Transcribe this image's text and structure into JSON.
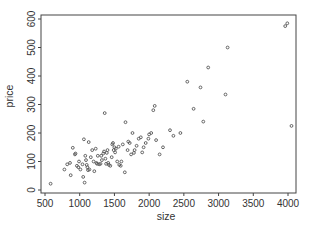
{
  "chart_data": {
    "type": "scatter",
    "title": "",
    "xlabel": "size",
    "ylabel": "price",
    "xlim": [
      430,
      4120
    ],
    "ylim": [
      -10,
      615
    ],
    "xticks": [
      500,
      1000,
      1500,
      2000,
      2500,
      3000,
      3500,
      4000
    ],
    "yticks": [
      0,
      100,
      200,
      300,
      400,
      500,
      600
    ],
    "xtick_labels": [
      "500",
      "1000",
      "1500",
      "2000",
      "2500",
      "3000",
      "3500",
      "4000"
    ],
    "ytick_labels": [
      "0",
      "100",
      "200",
      "300",
      "400",
      "500",
      "600"
    ],
    "grid": false,
    "legend": null,
    "marker_color": "#555555",
    "points": [
      [
        580,
        22
      ],
      [
        780,
        72
      ],
      [
        820,
        90
      ],
      [
        860,
        95
      ],
      [
        870,
        52
      ],
      [
        900,
        148
      ],
      [
        930,
        125
      ],
      [
        940,
        128
      ],
      [
        960,
        85
      ],
      [
        980,
        80
      ],
      [
        990,
        100
      ],
      [
        1010,
        72
      ],
      [
        1040,
        90
      ],
      [
        1050,
        46
      ],
      [
        1060,
        178
      ],
      [
        1070,
        26
      ],
      [
        1080,
        120
      ],
      [
        1090,
        105
      ],
      [
        1100,
        88
      ],
      [
        1110,
        80
      ],
      [
        1120,
        70
      ],
      [
        1130,
        168
      ],
      [
        1140,
        72
      ],
      [
        1160,
        115
      ],
      [
        1180,
        140
      ],
      [
        1200,
        100
      ],
      [
        1210,
        66
      ],
      [
        1230,
        145
      ],
      [
        1240,
        95
      ],
      [
        1250,
        92
      ],
      [
        1260,
        120
      ],
      [
        1280,
        90
      ],
      [
        1300,
        92
      ],
      [
        1310,
        120
      ],
      [
        1320,
        105
      ],
      [
        1340,
        128
      ],
      [
        1350,
        135
      ],
      [
        1360,
        270
      ],
      [
        1370,
        110
      ],
      [
        1380,
        92
      ],
      [
        1390,
        130
      ],
      [
        1400,
        140
      ],
      [
        1410,
        95
      ],
      [
        1420,
        88
      ],
      [
        1440,
        85
      ],
      [
        1460,
        115
      ],
      [
        1470,
        160
      ],
      [
        1480,
        165
      ],
      [
        1490,
        140
      ],
      [
        1500,
        150
      ],
      [
        1510,
        132
      ],
      [
        1520,
        145
      ],
      [
        1540,
        100
      ],
      [
        1560,
        152
      ],
      [
        1570,
        88
      ],
      [
        1590,
        85
      ],
      [
        1600,
        100
      ],
      [
        1620,
        160
      ],
      [
        1650,
        62
      ],
      [
        1660,
        238
      ],
      [
        1690,
        140
      ],
      [
        1700,
        170
      ],
      [
        1720,
        165
      ],
      [
        1740,
        125
      ],
      [
        1760,
        200
      ],
      [
        1780,
        130
      ],
      [
        1790,
        140
      ],
      [
        1820,
        155
      ],
      [
        1850,
        180
      ],
      [
        1880,
        185
      ],
      [
        1900,
        132
      ],
      [
        1920,
        150
      ],
      [
        1950,
        165
      ],
      [
        1990,
        180
      ],
      [
        2000,
        195
      ],
      [
        2030,
        200
      ],
      [
        2060,
        280
      ],
      [
        2080,
        295
      ],
      [
        2100,
        175
      ],
      [
        2150,
        125
      ],
      [
        2200,
        150
      ],
      [
        2300,
        210
      ],
      [
        2350,
        190
      ],
      [
        2450,
        200
      ],
      [
        2550,
        380
      ],
      [
        2640,
        285
      ],
      [
        2740,
        360
      ],
      [
        2780,
        240
      ],
      [
        2850,
        430
      ],
      [
        3100,
        335
      ],
      [
        3130,
        500
      ],
      [
        3960,
        575
      ],
      [
        3990,
        585
      ],
      [
        4050,
        225
      ]
    ]
  },
  "plot": {
    "frame_color": "#444444"
  }
}
